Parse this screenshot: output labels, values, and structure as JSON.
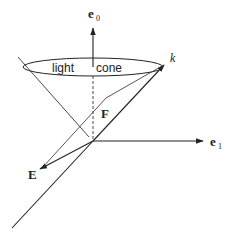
{
  "diagram": {
    "type": "light-cone vector diagram",
    "labels": {
      "e0": "e",
      "e0_sub": "0",
      "e1": "e",
      "e1_sub": "1",
      "k": "k",
      "F": "F",
      "E": "E",
      "cone_left": "light",
      "cone_right": "cone"
    },
    "colors": {
      "line": "#222222",
      "background": "#ffffff"
    }
  }
}
